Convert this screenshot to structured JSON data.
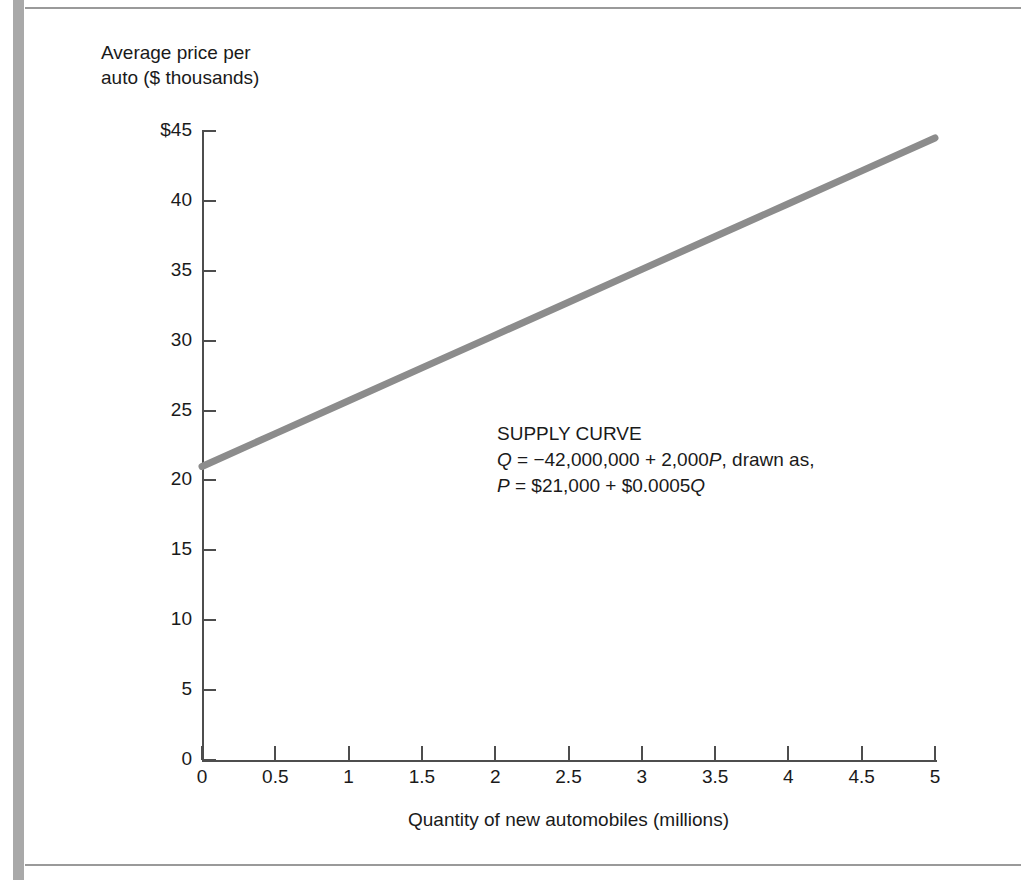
{
  "figure": {
    "background_color": "#ffffff",
    "frame_color": "#9a9a9a",
    "spine_color": "#a9a9a9"
  },
  "chart_data": {
    "type": "line",
    "title": "",
    "subtitle": "",
    "xlabel": "Quantity of new automobiles (millions)",
    "ylabel": "Average price per\nauto ($ thousands)",
    "xlim": [
      0,
      5
    ],
    "ylim": [
      0,
      45
    ],
    "grid": false,
    "legend_position": "none",
    "xticks": [
      0,
      0.5,
      1,
      1.5,
      2,
      2.5,
      3,
      3.5,
      4,
      4.5,
      5
    ],
    "xtick_labels": [
      "0",
      "0.5",
      "1",
      "1.5",
      "2",
      "2.5",
      "3",
      "3.5",
      "4",
      "4.5",
      "5"
    ],
    "yticks": [
      0,
      5,
      10,
      15,
      20,
      25,
      30,
      35,
      40,
      45
    ],
    "ytick_labels": [
      "0",
      "5",
      "10",
      "15",
      "20",
      "25",
      "30",
      "35",
      "40",
      "45"
    ],
    "ytick_label_top": "$45",
    "series": [
      {
        "name": "Supply curve",
        "color": "#8c8c8c",
        "line_width": 7,
        "x": [
          0,
          5
        ],
        "values": [
          21,
          44.5
        ],
        "points": [
          {
            "x": 0,
            "y": 21.0
          },
          {
            "x": 0.5,
            "y": 23.35
          },
          {
            "x": 1,
            "y": 25.7
          },
          {
            "x": 1.5,
            "y": 28.05
          },
          {
            "x": 2,
            "y": 30.4
          },
          {
            "x": 2.5,
            "y": 32.75
          },
          {
            "x": 3,
            "y": 35.1
          },
          {
            "x": 3.5,
            "y": 37.45
          },
          {
            "x": 4,
            "y": 39.8
          },
          {
            "x": 4.5,
            "y": 42.15
          },
          {
            "x": 5,
            "y": 44.5
          }
        ]
      }
    ],
    "annotations": [
      {
        "name": "supply-curve-annotation",
        "heading": "SUPPLY CURVE",
        "line2_prefix": "Q",
        "line2_body": " = −42,000,000 + 2,000",
        "line2_var": "P",
        "line2_suffix": ", drawn as,",
        "line3_prefix": "P",
        "line3_body": " = $21,000 + $0.0005",
        "line3_var": "Q",
        "x_data": 2.0,
        "y_data": 24.0
      }
    ]
  }
}
